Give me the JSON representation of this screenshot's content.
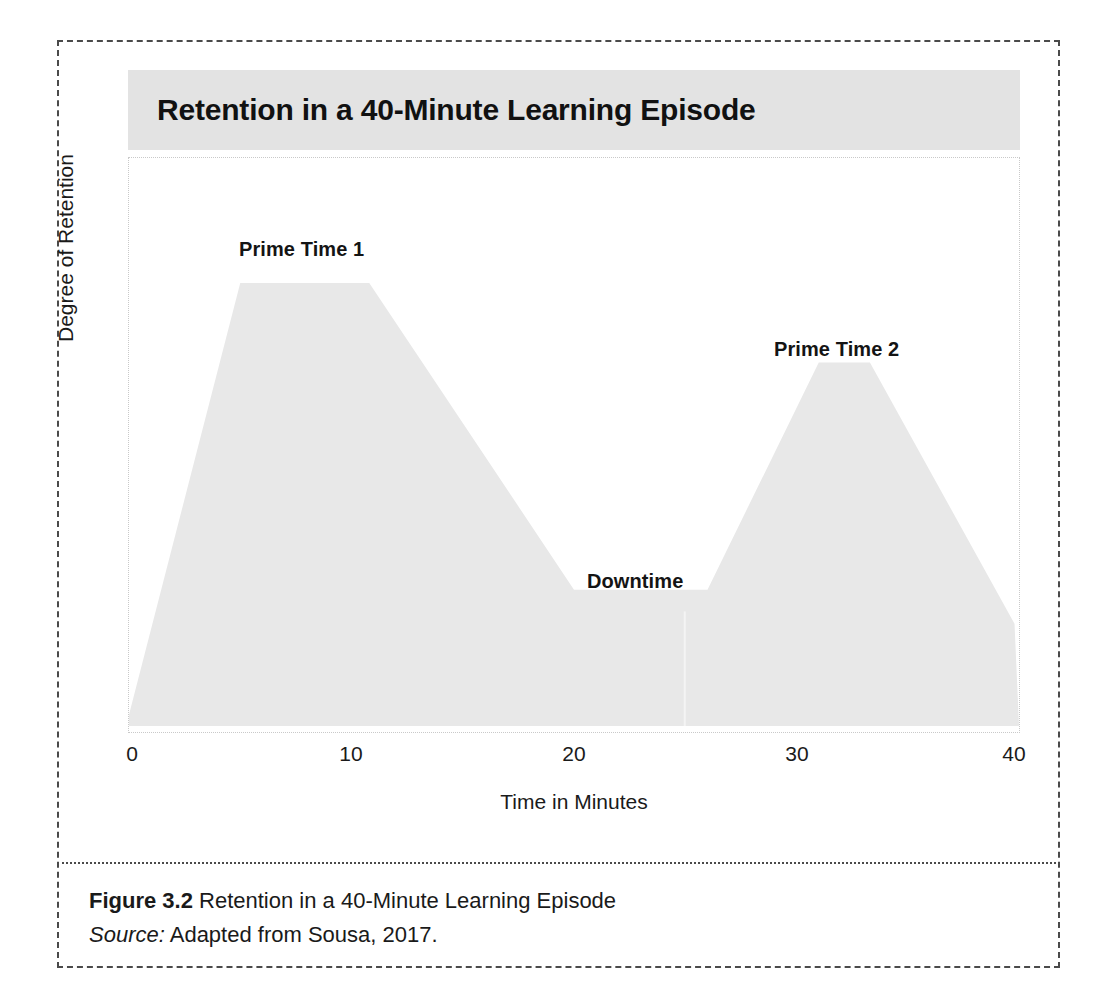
{
  "figure": {
    "title": "Retention in a 40-Minute Learning Episode",
    "caption_figure_number": "Figure 3.2",
    "caption_title": " Retention in a 40-Minute Learning Episode",
    "caption_source_word": "Source:",
    "caption_source_text": " Adapted from Sousa, 2017."
  },
  "colors": {
    "title_band": "#e3e3e3",
    "area_fill": "#e8e8e8",
    "frame_border": "#4a4a4a",
    "plot_border": "#c9c9c9",
    "text": "#1a1a1a"
  },
  "chart_data": {
    "type": "area",
    "title": "Retention in a 40-Minute Learning Episode",
    "xlabel": "Time in Minutes",
    "ylabel": "Degree of Retention",
    "xlim": [
      0,
      40
    ],
    "ylim": [
      0,
      100
    ],
    "xticks": [
      0,
      10,
      20,
      30,
      40
    ],
    "xticklabels": [
      "0",
      "10",
      "20",
      "30",
      "40"
    ],
    "yticks": [],
    "yticklabels": [],
    "grid": false,
    "legend": "none",
    "series": [
      {
        "name": "Degree of Retention",
        "x": [
          0,
          5.0,
          10.8,
          20.0,
          26.0,
          31.0,
          33.3,
          39.8,
          40
        ],
        "values": [
          2,
          78,
          78,
          24,
          24,
          64,
          64,
          18,
          0
        ]
      }
    ],
    "annotations": [
      {
        "label": "Prime Time 1",
        "x": 8.0,
        "y": 90,
        "note": "first high-retention peak plateau"
      },
      {
        "label": "Downtime",
        "x": 22.5,
        "y": 31,
        "note": "low-retention trough between peaks"
      },
      {
        "label": "Prime Time 2",
        "x": 32.0,
        "y": 76,
        "note": "second high-retention peak plateau"
      }
    ]
  },
  "axis": {
    "x_label": "Time in Minutes",
    "y_label": "Degree of Retention",
    "x_ticks": [
      "0",
      "10",
      "20",
      "30",
      "40"
    ]
  },
  "labels": {
    "prime_time_1": "Prime Time 1",
    "downtime": "Downtime",
    "prime_time_2": "Prime Time 2"
  }
}
